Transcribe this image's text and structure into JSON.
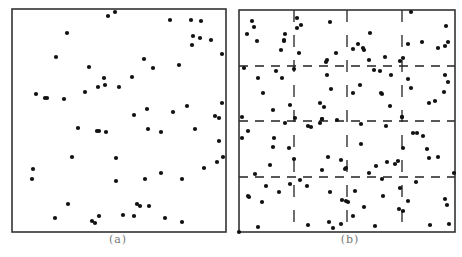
{
  "figure": {
    "panels": [
      {
        "id": "a",
        "caption": "(a)",
        "caption_x": 118,
        "box": {
          "x": 12,
          "y": 9,
          "w": 214,
          "h": 223
        },
        "grid": false,
        "points": [
          [
            108,
            16
          ],
          [
            115,
            12
          ],
          [
            67,
            33
          ],
          [
            56,
            57
          ],
          [
            89,
            67
          ],
          [
            104,
            78
          ],
          [
            98,
            87
          ],
          [
            105,
            85
          ],
          [
            85,
            92
          ],
          [
            36,
            94
          ],
          [
            45,
            98
          ],
          [
            47,
            98
          ],
          [
            64,
            99
          ],
          [
            119,
            87
          ],
          [
            170,
            20
          ],
          [
            191,
            20
          ],
          [
            201,
            21
          ],
          [
            193,
            36
          ],
          [
            200,
            38
          ],
          [
            211,
            40
          ],
          [
            192,
            45
          ],
          [
            222,
            54
          ],
          [
            144,
            59
          ],
          [
            153,
            68
          ],
          [
            179,
            65
          ],
          [
            132,
            77
          ],
          [
            222,
            103
          ],
          [
            187,
            106
          ],
          [
            147,
            109
          ],
          [
            134,
            115
          ],
          [
            173,
            112
          ],
          [
            215,
            116
          ],
          [
            219,
            118
          ],
          [
            78,
            128
          ],
          [
            97,
            131
          ],
          [
            99,
            131
          ],
          [
            106,
            132
          ],
          [
            72,
            157
          ],
          [
            116,
            158
          ],
          [
            33,
            169
          ],
          [
            32,
            179
          ],
          [
            116,
            181
          ],
          [
            68,
            204
          ],
          [
            55,
            218
          ],
          [
            99,
            216
          ],
          [
            92,
            221
          ],
          [
            95,
            223
          ],
          [
            148,
            129
          ],
          [
            161,
            132
          ],
          [
            195,
            129
          ],
          [
            219,
            141
          ],
          [
            223,
            157
          ],
          [
            217,
            162
          ],
          [
            204,
            168
          ],
          [
            161,
            173
          ],
          [
            145,
            179
          ],
          [
            182,
            179
          ],
          [
            137,
            204
          ],
          [
            140,
            206
          ],
          [
            149,
            206
          ],
          [
            123,
            215
          ],
          [
            134,
            216
          ],
          [
            165,
            218
          ],
          [
            182,
            222
          ]
        ]
      },
      {
        "id": "b",
        "caption": "(b)",
        "caption_x": 350,
        "box": {
          "x": 239,
          "y": 10,
          "w": 216,
          "h": 222
        },
        "grid": true,
        "grid_x": [
          294,
          347,
          402
        ],
        "grid_y": [
          66,
          121,
          177
        ],
        "points": [
          [
            252,
            21
          ],
          [
            254,
            27
          ],
          [
            247,
            34
          ],
          [
            257,
            41
          ],
          [
            285,
            34
          ],
          [
            284,
            40
          ],
          [
            284,
            41
          ],
          [
            281,
            50
          ],
          [
            297,
            18
          ],
          [
            297,
            28
          ],
          [
            301,
            25
          ],
          [
            299,
            53
          ],
          [
            330,
            22
          ],
          [
            336,
            53
          ],
          [
            327,
            60
          ],
          [
            326,
            62
          ],
          [
            244,
            68
          ],
          [
            276,
            71
          ],
          [
            294,
            69
          ],
          [
            258,
            78
          ],
          [
            282,
            78
          ],
          [
            327,
            75
          ],
          [
            331,
            89
          ],
          [
            263,
            93
          ],
          [
            290,
            105
          ],
          [
            320,
            103
          ],
          [
            324,
            107
          ],
          [
            273,
            110
          ],
          [
            242,
            117
          ],
          [
            295,
            118
          ],
          [
            322,
            119
          ],
          [
            411,
            12
          ],
          [
            370,
            33
          ],
          [
            446,
            26
          ],
          [
            358,
            44
          ],
          [
            353,
            49
          ],
          [
            363,
            48
          ],
          [
            364,
            50
          ],
          [
            408,
            44
          ],
          [
            422,
            42
          ],
          [
            438,
            48
          ],
          [
            445,
            46
          ],
          [
            448,
            42
          ],
          [
            369,
            60
          ],
          [
            385,
            57
          ],
          [
            400,
            61
          ],
          [
            403,
            58
          ],
          [
            374,
            70
          ],
          [
            380,
            71
          ],
          [
            391,
            75
          ],
          [
            408,
            79
          ],
          [
            445,
            75
          ],
          [
            448,
            82
          ],
          [
            360,
            85
          ],
          [
            411,
            88
          ],
          [
            353,
            93
          ],
          [
            381,
            93
          ],
          [
            382,
            94
          ],
          [
            444,
            92
          ],
          [
            390,
            106
          ],
          [
            429,
            103
          ],
          [
            435,
            101
          ],
          [
            402,
            117
          ],
          [
            285,
            123
          ],
          [
            308,
            126
          ],
          [
            311,
            127
          ],
          [
            320,
            123
          ],
          [
            322,
            119
          ],
          [
            337,
            120
          ],
          [
            248,
            131
          ],
          [
            242,
            138
          ],
          [
            274,
            138
          ],
          [
            273,
            147
          ],
          [
            289,
            148
          ],
          [
            294,
            159
          ],
          [
            328,
            157
          ],
          [
            341,
            160
          ],
          [
            270,
            165
          ],
          [
            322,
            170
          ],
          [
            345,
            169
          ],
          [
            255,
            174
          ],
          [
            290,
            184
          ],
          [
            300,
            180
          ],
          [
            307,
            186
          ],
          [
            266,
            186
          ],
          [
            279,
            192
          ],
          [
            330,
            192
          ],
          [
            248,
            196
          ],
          [
            249,
            197
          ],
          [
            262,
            202
          ],
          [
            342,
            200
          ],
          [
            346,
            201
          ],
          [
            239,
            232
          ],
          [
            258,
            227
          ],
          [
            308,
            225
          ],
          [
            329,
            222
          ],
          [
            333,
            228
          ],
          [
            341,
            224
          ],
          [
            361,
            124
          ],
          [
            386,
            126
          ],
          [
            402,
            117
          ],
          [
            413,
            133
          ],
          [
            417,
            133
          ],
          [
            423,
            136
          ],
          [
            361,
            144
          ],
          [
            403,
            148
          ],
          [
            427,
            149
          ],
          [
            429,
            158
          ],
          [
            438,
            157
          ],
          [
            376,
            166
          ],
          [
            387,
            162
          ],
          [
            395,
            164
          ],
          [
            398,
            161
          ],
          [
            346,
            168
          ],
          [
            369,
            173
          ],
          [
            382,
            179
          ],
          [
            416,
            182
          ],
          [
            454,
            173
          ],
          [
            355,
            191
          ],
          [
            400,
            188
          ],
          [
            383,
            196
          ],
          [
            348,
            202
          ],
          [
            408,
            201
          ],
          [
            445,
            199
          ],
          [
            447,
            205
          ],
          [
            364,
            207
          ],
          [
            399,
            209
          ],
          [
            403,
            211
          ],
          [
            353,
            216
          ],
          [
            375,
            226
          ],
          [
            430,
            225
          ],
          [
            449,
            224
          ]
        ]
      }
    ],
    "style": {
      "border_color": "#333333",
      "point_color": "#111111",
      "grid_color": "#222222",
      "caption_color": "#777777"
    }
  }
}
